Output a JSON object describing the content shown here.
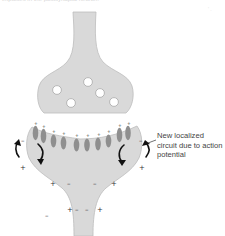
{
  "caption": "impulses in the postsynaptic neuron.",
  "corner_mark": "' .",
  "colors": {
    "cell_fill": "#d9d9d9",
    "cell_stroke": "#b5b5b5",
    "channel_fill": "#8f8f8f",
    "arrow": "#111111",
    "vesicle_fill": "#ffffff"
  },
  "presynaptic": {
    "label": "presynaptic terminal",
    "vesicles": 5
  },
  "postsynaptic": {
    "label": "postsynaptic neuron",
    "channels": 10,
    "charges_top": [
      "+",
      "+",
      "+",
      "+",
      "+",
      "+",
      "+",
      "+",
      "+",
      "+"
    ]
  },
  "annotation": {
    "text": "New localized circuit due to action potential"
  },
  "charges": {
    "left_outer_minus": "–",
    "left_lower_plus": "+",
    "right_outer_minus": "–",
    "right_lower_plus": "+",
    "row1": [
      "+",
      "–",
      "–",
      "+"
    ],
    "row2": [
      "+",
      "–",
      "–",
      "+"
    ],
    "bottom_left_minus": "–"
  }
}
